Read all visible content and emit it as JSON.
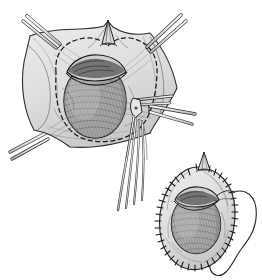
{
  "document": {
    "title": "Surgical technique illustration",
    "domain": "medical-line-drawing",
    "canvas": {
      "width": 262,
      "height": 280,
      "background": "#ffffff"
    }
  },
  "palette": {
    "ink": "#1a1a1a",
    "ink_soft": "#3c3c3c",
    "ink_faint": "#8a8a8a",
    "paper": "#ffffff",
    "tissue_light": "#e2e2e0",
    "tissue_mid": "#d2d2d0",
    "tissue_shadow": "#b9b9b7",
    "organ_fill": "#a9a9a7",
    "organ_shadow": "#8d8d8b",
    "organ_rim_dark": "#4a4a4a",
    "instrument_fill": "#f2f2f2",
    "instrument_shade": "#c9c9c9"
  },
  "figures": [
    {
      "id": "figure-upper",
      "name": "Exposed organ within retracted tissue sheet",
      "position": {
        "x": 8,
        "y": 8,
        "width": 185,
        "height": 170
      },
      "elements": {
        "tissue_sheet": {
          "name": "retracted tissue sheet",
          "shape": "concave quadrilateral",
          "fill": "#e2e2e0"
        },
        "apex_peak": {
          "name": "tented tissue peak",
          "position": {
            "x": 108,
            "y": 24
          },
          "height": 16
        },
        "incision_outline": {
          "name": "dashed excision line",
          "style": "dashed",
          "dash_pattern": "4 3",
          "shape": "oval"
        },
        "organ": {
          "name": "exposed organ body",
          "shape": "ovoid",
          "center": {
            "x": 95,
            "y": 100
          },
          "rx": 32,
          "ry": 38,
          "fill": "#a9a9a7",
          "hatching": "fine parallel curved lines"
        },
        "organ_rim": {
          "name": "cut tunica edge",
          "position": "superior pole",
          "fill": "#4a4a4a"
        }
      },
      "instruments": [
        {
          "id": "clamp-top-left",
          "name": "hemostat clamp",
          "tip": {
            "x": 58,
            "y": 42
          },
          "tail": {
            "x": 30,
            "y": 18
          },
          "angle_deg": -40
        },
        {
          "id": "clamp-top-right",
          "name": "hemostat clamp",
          "tip": {
            "x": 148,
            "y": 46
          },
          "tail": {
            "x": 178,
            "y": 16
          },
          "angle_deg": 44
        },
        {
          "id": "clamp-bottom-left",
          "name": "hemostat clamp",
          "tip": {
            "x": 45,
            "y": 137
          },
          "tail": {
            "x": 12,
            "y": 155
          },
          "angle_deg": 28
        },
        {
          "id": "clamp-right-mid",
          "name": "hemostat clamp",
          "tip": {
            "x": 152,
            "y": 106
          },
          "tail": {
            "x": 192,
            "y": 120
          },
          "angle_deg": 20
        },
        {
          "id": "scissors-long",
          "name": "long dissecting scissors",
          "tip": {
            "x": 140,
            "y": 104
          },
          "tail": {
            "x": 118,
            "y": 212
          },
          "shank_count": 4
        }
      ]
    },
    {
      "id": "figure-lower-right",
      "name": "Everted tissue sac with running suture border",
      "position": {
        "x": 158,
        "y": 152,
        "width": 100,
        "height": 126
      },
      "elements": {
        "tissue_sac": {
          "name": "everted tissue sac",
          "shape": "oval",
          "center": {
            "x": 197,
            "y": 218
          },
          "rx": 38,
          "ry": 52,
          "fill": "#e2e2e0"
        },
        "suture_border": {
          "name": "running suture edge",
          "style": "stippled stitches",
          "stitch_count": 44
        },
        "apex_peak": {
          "name": "tented tissue peak",
          "position": {
            "x": 204,
            "y": 155
          },
          "height": 14
        },
        "organ": {
          "name": "enclosed organ body",
          "shape": "ovoid",
          "center": {
            "x": 196,
            "y": 224
          },
          "rx": 25,
          "ry": 30,
          "fill": "#a9a9a7",
          "hatching": "fine parallel curved lines"
        },
        "organ_rim": {
          "name": "cut tunica edge",
          "position": "superior pole",
          "fill": "#4a4a4a"
        },
        "lateral_flap": {
          "name": "reflected lateral flap outline",
          "shape": "hook",
          "position": {
            "x": 224,
            "y": 186,
            "width": 36,
            "height": 92
          },
          "fill": "none"
        }
      }
    }
  ]
}
